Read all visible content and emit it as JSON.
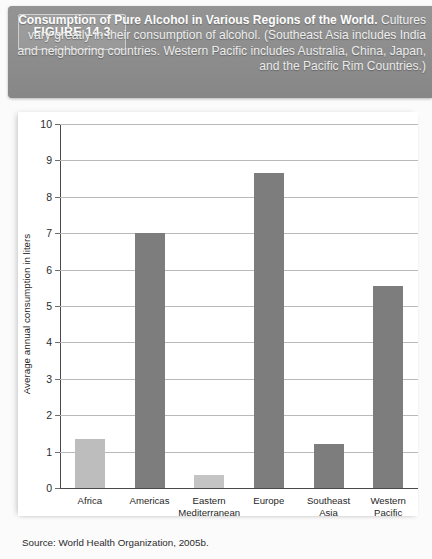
{
  "header": {
    "figure_tag": "FIGURE 14.3",
    "caption_bold": "Consumption of Pure Alcohol in Various Regions of the World.",
    "caption_rest": " Cultures vary greatly in their consumption of alcohol. (Southeast Asia includes India and neighboring countries. Western Pacific includes Australia, China, Japan, and the Pacific Rim Countries.)",
    "background_color": "#8e8e8e",
    "tag_background_color": "#9a9a9a"
  },
  "source": {
    "text": "Source: World Health Organization, 2005b."
  },
  "chart_data": {
    "type": "bar",
    "title": "Consumption of Pure Alcohol in Various Regions of the World",
    "xlabel": "",
    "ylabel": "Average annual consumption in liters",
    "ylim": [
      0,
      10
    ],
    "yticks": [
      0,
      1,
      2,
      3,
      4,
      5,
      6,
      7,
      8,
      9,
      10
    ],
    "ytick_labels": [
      "0",
      "1",
      "2",
      "3",
      "4",
      "5",
      "6",
      "7",
      "8",
      "9",
      "10"
    ],
    "grid": true,
    "legend": "none",
    "categories": [
      "Africa",
      "Americas",
      "Eastern Mediterranean",
      "Europe",
      "Southeast Asia",
      "Western Pacific"
    ],
    "category_labels": [
      "Africa",
      "Americas",
      "Eastern\nMediterranean",
      "Europe",
      "Southeast\nAsia",
      "Western\nPacific"
    ],
    "values": [
      1.35,
      7.0,
      0.35,
      8.65,
      1.2,
      5.55
    ],
    "bar_colors": [
      "#bdbdbd",
      "#7d7d7d",
      "#c4c4c4",
      "#7d7d7d",
      "#7d7d7d",
      "#7d7d7d"
    ],
    "bar_width_px": 30,
    "grid_color": "#b9b9b9",
    "axis_color": "#4a4a4a"
  }
}
